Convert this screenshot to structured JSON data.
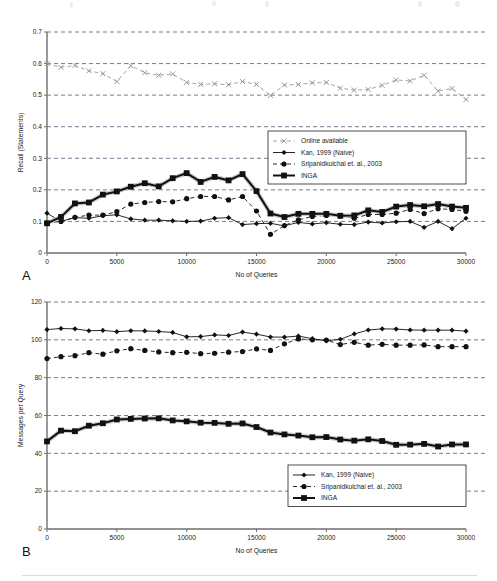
{
  "figure": {
    "bottom_rule": true,
    "background": "#ffffff"
  },
  "chart_data": [
    {
      "id": "panel-a",
      "type": "line",
      "panel_label": "A",
      "title": "",
      "xlabel": "No of Queries",
      "ylabel": "Recall (Statements)",
      "xlim": [
        0,
        30000
      ],
      "ylim": [
        0,
        0.7
      ],
      "xticks": [
        0,
        5000,
        10000,
        15000,
        20000,
        25000,
        30000
      ],
      "xticklabels": [
        "0",
        "5000",
        "10000",
        "15000",
        "20000",
        "25000",
        "30000"
      ],
      "yticks": [
        0,
        0.1,
        0.2,
        0.3,
        0.4,
        0.5,
        0.6,
        0.7
      ],
      "yticklabels": [
        "0",
        "0.1",
        "0.2",
        "0.3",
        "0.4",
        "0.5",
        "0.6",
        "0.7"
      ],
      "grid": "horizontal-dashed",
      "legend_position": "center-right",
      "x": [
        0,
        1000,
        2000,
        3000,
        4000,
        5000,
        6000,
        7000,
        8000,
        9000,
        10000,
        11000,
        12000,
        13000,
        14000,
        15000,
        16000,
        17000,
        18000,
        19000,
        20000,
        21000,
        22000,
        23000,
        24000,
        25000,
        26000,
        27000,
        28000,
        29000,
        30000
      ],
      "series": [
        {
          "name": "Online available",
          "marker": "x",
          "linestyle": "dashed",
          "color": "#9a9a9a",
          "values": [
            0.6,
            0.588,
            0.594,
            0.577,
            0.568,
            0.543,
            0.593,
            0.571,
            0.563,
            0.567,
            0.54,
            0.534,
            0.536,
            0.533,
            0.543,
            0.534,
            0.499,
            0.532,
            0.534,
            0.539,
            0.54,
            0.522,
            0.516,
            0.518,
            0.531,
            0.548,
            0.545,
            0.563,
            0.513,
            0.521,
            0.486,
            0.491
          ]
        },
        {
          "name": "Kan, 1999 (Naive)",
          "marker": "diamond",
          "linestyle": "solid",
          "color": "#111111",
          "values": [
            0.126,
            0.1,
            0.112,
            0.11,
            0.118,
            0.121,
            0.108,
            0.104,
            0.104,
            0.102,
            0.1,
            0.101,
            0.11,
            0.112,
            0.09,
            0.093,
            0.094,
            0.086,
            0.097,
            0.092,
            0.096,
            0.091,
            0.09,
            0.098,
            0.095,
            0.099,
            0.1,
            0.081,
            0.1,
            0.077,
            0.11
          ]
        },
        {
          "name": "Sripanidkulchai et. al., 2003",
          "marker": "circle",
          "linestyle": "dashed",
          "color": "#111111",
          "values": [
            0.095,
            0.1,
            0.113,
            0.12,
            0.12,
            0.131,
            0.155,
            0.16,
            0.163,
            0.162,
            0.172,
            0.179,
            0.179,
            0.168,
            0.179,
            0.133,
            0.059,
            0.087,
            0.105,
            0.116,
            0.119,
            0.117,
            0.11,
            0.122,
            0.122,
            0.126,
            0.138,
            0.125,
            0.14,
            0.138,
            0.132
          ]
        },
        {
          "name": "INGA",
          "marker": "square",
          "linestyle": "solid-thick",
          "color": "#111111",
          "values": [
            0.094,
            0.114,
            0.157,
            0.16,
            0.185,
            0.195,
            0.21,
            0.221,
            0.211,
            0.237,
            0.253,
            0.225,
            0.241,
            0.23,
            0.25,
            0.196,
            0.125,
            0.114,
            0.124,
            0.124,
            0.124,
            0.118,
            0.119,
            0.135,
            0.13,
            0.147,
            0.152,
            0.148,
            0.155,
            0.147,
            0.143
          ]
        }
      ]
    },
    {
      "id": "panel-b",
      "type": "line",
      "panel_label": "B",
      "title": "",
      "xlabel": "No of Queries",
      "ylabel": "Messages per Query",
      "xlim": [
        0,
        30000
      ],
      "ylim": [
        0,
        120
      ],
      "xticks": [
        0,
        5000,
        10000,
        15000,
        20000,
        25000,
        30000
      ],
      "xticklabels": [
        "0",
        "5000",
        "10000",
        "15000",
        "20000",
        "25000",
        "30000"
      ],
      "yticks": [
        0,
        20,
        40,
        60,
        80,
        100,
        120
      ],
      "yticklabels": [
        "0",
        "20",
        "40",
        "60",
        "80",
        "100",
        "120"
      ],
      "grid": "horizontal-dashed",
      "legend_position": "bottom-right",
      "x": [
        0,
        1000,
        2000,
        3000,
        4000,
        5000,
        6000,
        7000,
        8000,
        9000,
        10000,
        11000,
        12000,
        13000,
        14000,
        15000,
        16000,
        17000,
        18000,
        19000,
        20000,
        21000,
        22000,
        23000,
        24000,
        25000,
        26000,
        27000,
        28000,
        29000,
        30000
      ],
      "series": [
        {
          "name": "Kan, 1999 (Naive)",
          "marker": "diamond",
          "linestyle": "solid",
          "color": "#111111",
          "values": [
            105.4,
            106.0,
            105.8,
            104.8,
            105.0,
            104.3,
            104.8,
            104.7,
            104.4,
            103.9,
            101.6,
            101.7,
            102.6,
            102.3,
            104.1,
            103.0,
            101.5,
            101.4,
            102.0,
            100.6,
            99.5,
            100.3,
            103.1,
            105.2,
            105.8,
            105.7,
            105.2,
            105.1,
            105.1,
            105.1,
            104.6
          ]
        },
        {
          "name": "Sripanidkulchai et. al., 2003",
          "marker": "circle",
          "linestyle": "dashed",
          "color": "#111111",
          "values": [
            90.1,
            91.1,
            91.6,
            93.2,
            92.4,
            94.2,
            95.3,
            94.4,
            93.6,
            93.2,
            93.4,
            92.7,
            92.9,
            93.5,
            93.8,
            95.2,
            94.4,
            97.9,
            100.5,
            100.0,
            99.9,
            97.5,
            98.7,
            97.2,
            97.6,
            97.2,
            97.2,
            97.3,
            96.4,
            96.4,
            96.4
          ]
        },
        {
          "name": "INGA",
          "marker": "square",
          "linestyle": "solid-thick",
          "color": "#111111",
          "values": [
            46.3,
            52.0,
            51.7,
            54.6,
            55.9,
            57.9,
            58.2,
            58.4,
            58.5,
            57.4,
            56.9,
            56.2,
            56.1,
            55.6,
            55.8,
            53.9,
            51.0,
            50.0,
            49.4,
            48.5,
            48.6,
            47.3,
            46.7,
            47.4,
            46.5,
            44.5,
            44.6,
            45.0,
            43.6,
            44.7,
            44.7
          ]
        }
      ]
    }
  ]
}
